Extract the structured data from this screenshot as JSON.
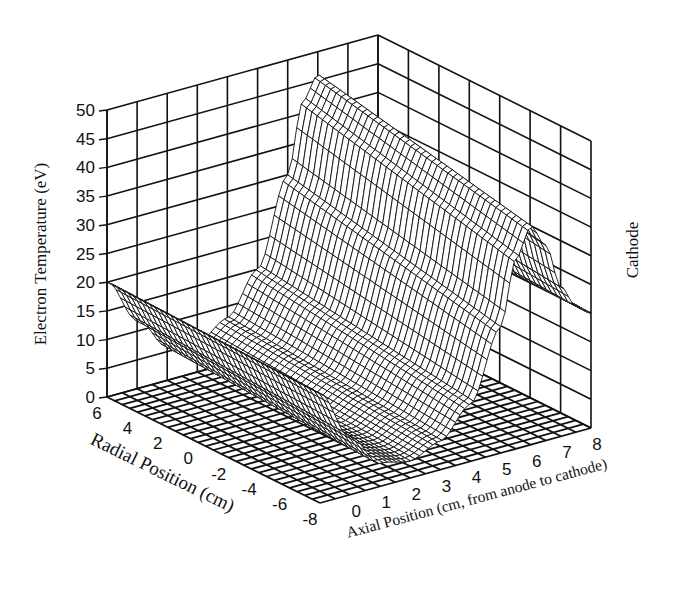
{
  "chart_data": {
    "type": "surface3d",
    "title": "",
    "zlabel": "Electron Temperature (eV)",
    "ylabel": "Radial Position (cm)",
    "xlabel": "Axial Position (cm, from anode to cathode)",
    "annotation": "Cathode",
    "z_ticks": [
      0,
      5,
      10,
      15,
      20,
      25,
      30,
      35,
      40,
      45,
      50
    ],
    "radial_ticks": [
      6,
      4,
      2,
      0,
      -2,
      -4,
      -6,
      -8
    ],
    "axial_ticks": [
      0,
      1,
      2,
      3,
      4,
      5,
      6,
      7,
      8
    ],
    "zlim": [
      0,
      50
    ],
    "radial_range": [
      6,
      -8
    ],
    "axial_range": [
      -1,
      8
    ],
    "grid": true,
    "surface_description": "Electron temperature vs axial and radial position; low (~2-5 eV) near anode at axial 0-2 cm, rising steeply to a peak ~46 eV near axial ~5.5-6 cm at radial +6 cm, falling toward cathode (~20 eV at axial 8). Radially the peak decreases from ~46 eV (radial 6) to ~38 eV (radial -8). At the anode end T is ~20 eV at radial 6 edge.",
    "samples": {
      "axial": [
        -1,
        0,
        1,
        2,
        3,
        4,
        5,
        5.5,
        6,
        6.5,
        7,
        7.5,
        8
      ],
      "radial_6": [
        20,
        12,
        6,
        5,
        8,
        15,
        30,
        42,
        46,
        40,
        30,
        24,
        21
      ],
      "radial_-8": [
        19,
        10,
        4,
        3,
        5,
        10,
        22,
        33,
        38,
        34,
        26,
        22,
        20
      ]
    }
  },
  "labels": {
    "zlabel": "Electron Temperature (eV)",
    "ylabel": "Radial Position (cm)",
    "xlabel": "Axial Position (cm, from anode to cathode)",
    "annotation": "Cathode"
  }
}
